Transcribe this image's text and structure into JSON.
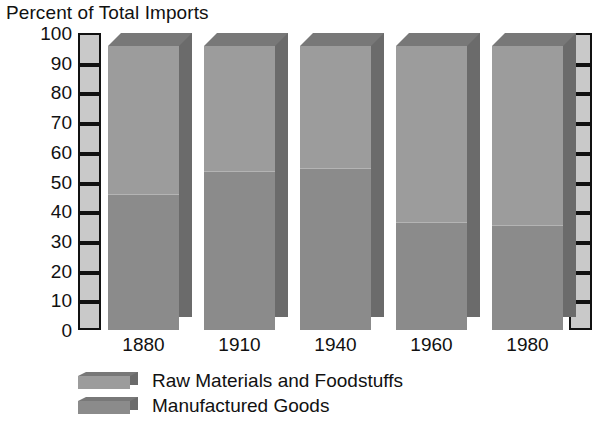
{
  "chart_data": {
    "type": "bar",
    "title": "Percent of Total Imports",
    "xlabel": "",
    "ylabel": "",
    "ylim": [
      0,
      100
    ],
    "ytick_step": 10,
    "yticks": [
      100,
      90,
      80,
      70,
      60,
      50,
      40,
      30,
      20,
      10,
      0
    ],
    "grid": false,
    "stacked": true,
    "legend_position": "bottom-left",
    "style": "3d-stacked-column",
    "categories": [
      "1880",
      "1910",
      "1940",
      "1960",
      "1980"
    ],
    "series": [
      {
        "name": "Manufactured Goods",
        "color": "#8b8b8b",
        "values": [
          48,
          56,
          57,
          38,
          37
        ]
      },
      {
        "name": "Raw Materials and Foodstuffs",
        "color": "#9c9c9c",
        "values": [
          52,
          44,
          43,
          62,
          63
        ]
      }
    ],
    "annotations": []
  },
  "legend": {
    "items": [
      {
        "label": "Raw Materials and Foodstuffs",
        "color": "#9c9c9c"
      },
      {
        "label": "Manufactured Goods",
        "color": "#8b8b8b"
      }
    ]
  },
  "colors": {
    "bar_top_segment": "#9c9c9c",
    "bar_bottom_segment": "#8b8b8b",
    "bar_side_face": "#6b6b6b",
    "bar_top_face": "#787878",
    "axis_ladder_fill": "#c9c9c9",
    "axis_line": "#111111",
    "background": "#ffffff",
    "text": "#111111"
  }
}
